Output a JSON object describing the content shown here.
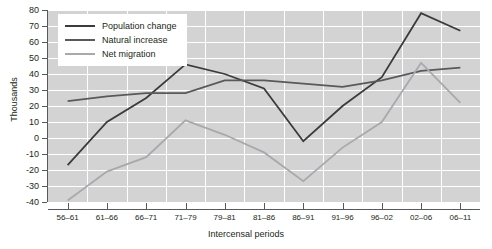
{
  "chart_data": {
    "type": "line",
    "title": "",
    "xlabel": "Intercensal periods",
    "ylabel": "Thousands",
    "categories": [
      "56–61",
      "61–66",
      "66–71",
      "71–79",
      "79–81",
      "81–86",
      "86–91",
      "91–96",
      "96–02",
      "02–06",
      "06–11"
    ],
    "ylim": [
      -40,
      80
    ],
    "yticks": [
      80,
      70,
      60,
      50,
      40,
      30,
      20,
      10,
      0,
      -10,
      -20,
      -30,
      -40
    ],
    "ytick_labels": [
      "80",
      "70",
      "60",
      "50",
      "40",
      "30",
      "20",
      "10",
      "0",
      "-10",
      "-20",
      "-30",
      "-40"
    ],
    "grid": true,
    "legend_position": "top-left",
    "series": [
      {
        "name": "Population change",
        "color": "#3b3b3d",
        "values": [
          -17,
          10,
          25,
          46,
          40,
          31,
          -2,
          20,
          38,
          78,
          67
        ]
      },
      {
        "name": "Natural increase",
        "color": "#58595b",
        "values": [
          23,
          26,
          28,
          28,
          36,
          36,
          34,
          32,
          36,
          42,
          44
        ]
      },
      {
        "name": "Net migration",
        "color": "#a7a9ac",
        "values": [
          -39,
          -21,
          -12,
          11,
          2,
          -9,
          -27,
          -6,
          10,
          47,
          22
        ]
      }
    ]
  },
  "colors": {
    "plot_background": "#d3d3d3",
    "gridline": "#ffffff",
    "axis": "#58595b",
    "text": "#231f20",
    "page_background": "#ffffff"
  }
}
